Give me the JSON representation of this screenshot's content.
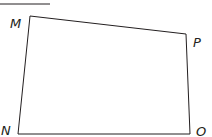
{
  "diagram": {
    "type": "quadrilateral",
    "stroke_color": "#231f20",
    "vertices": [
      {
        "name": "M",
        "x": 30,
        "y": 16,
        "label_x": 10,
        "label_y": 28
      },
      {
        "name": "P",
        "x": 186,
        "y": 34,
        "label_x": 193,
        "label_y": 47
      },
      {
        "name": "O",
        "x": 190,
        "y": 134,
        "label_x": 196,
        "label_y": 136
      },
      {
        "name": "N",
        "x": 18,
        "y": 134,
        "label_x": 1,
        "label_y": 135
      }
    ],
    "top_rule": {
      "x1": 0,
      "y1": 4,
      "x2": 50,
      "y2": 4
    }
  }
}
